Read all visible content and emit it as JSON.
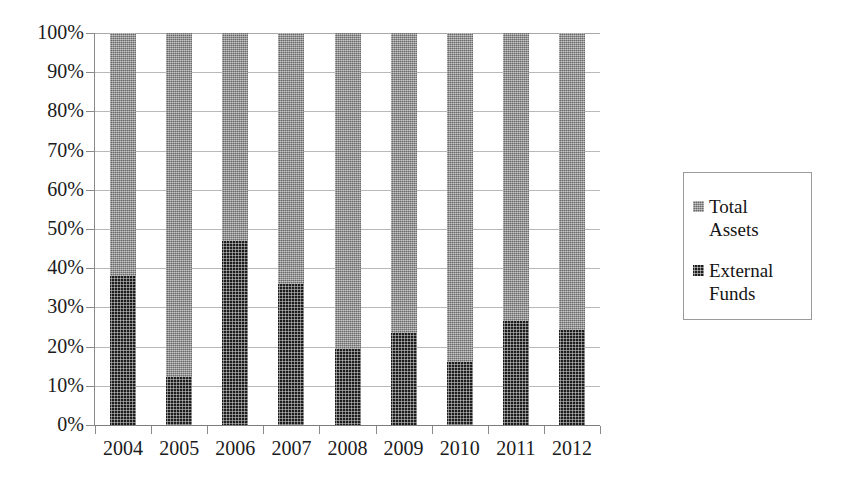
{
  "chart_data": {
    "type": "bar",
    "subtype": "stacked-100-percent",
    "title": "",
    "subtitle": "",
    "xlabel": "",
    "ylabel": "",
    "categories": [
      "2004",
      "2005",
      "2006",
      "2007",
      "2008",
      "2009",
      "2010",
      "2011",
      "2012"
    ],
    "series": [
      {
        "name": "External Funds",
        "color": "#1d1d1d",
        "values": [
          38.0,
          12.3,
          47.0,
          36.0,
          19.4,
          23.5,
          16.1,
          26.5,
          24.2
        ]
      },
      {
        "name": "Total Assets",
        "color": "#8d8d8d",
        "values": [
          62.0,
          87.7,
          53.0,
          64.0,
          80.6,
          76.5,
          83.9,
          73.5,
          75.8
        ]
      }
    ],
    "stack_order": [
      "External Funds",
      "Total Assets"
    ],
    "ylim": [
      0,
      100
    ],
    "y_ticks": [
      "0%",
      "10%",
      "20%",
      "30%",
      "40%",
      "50%",
      "60%",
      "70%",
      "80%",
      "90%",
      "100%"
    ],
    "y_tick_values": [
      0,
      10,
      20,
      30,
      40,
      50,
      60,
      70,
      80,
      90,
      100
    ],
    "x_ticks": [
      "2004",
      "2005",
      "2006",
      "2007",
      "2008",
      "2009",
      "2010",
      "2011",
      "2012"
    ],
    "grid": true,
    "grid_axis": "y",
    "legend_position": "right",
    "legend_entries": [
      {
        "label": "Total\nAssets",
        "color": "#8d8d8d"
      },
      {
        "label": "External\nFunds",
        "color": "#1d1d1d"
      }
    ],
    "background_color": "#ffffff",
    "gridline_color": "#b9b9b9",
    "axis_color": "#8a8a8a"
  }
}
